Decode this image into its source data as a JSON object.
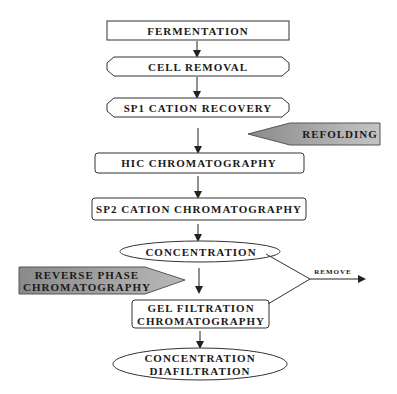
{
  "diagram": {
    "steps": [
      {
        "id": "fermentation",
        "label": "FERMENTATION",
        "shape": "rectangle"
      },
      {
        "id": "cell-removal",
        "label": "CELL REMOVAL",
        "shape": "hexagon"
      },
      {
        "id": "sp1-cation-recovery",
        "label": "SP1 CATION RECOVERY",
        "shape": "hexagon"
      },
      {
        "id": "hic-chromatography",
        "label": "HIC CHROMATOGRAPHY",
        "shape": "rounded-rectangle"
      },
      {
        "id": "sp2-cation-chromatography",
        "label": "SP2 CATION CHROMATOGRAPHY",
        "shape": "rounded-rectangle"
      },
      {
        "id": "concentration",
        "label": "CONCENTRATION",
        "shape": "ellipse"
      },
      {
        "id": "gel-filtration",
        "label_line1": "GEL FILTRATION",
        "label_line2": "CHROMATOGRAPHY",
        "shape": "rounded-rectangle"
      },
      {
        "id": "concentration-diafiltration",
        "label_line1": "CONCENTRATION",
        "label_line2": "DIAFILTRATION",
        "shape": "ellipse"
      }
    ],
    "side_inputs": [
      {
        "id": "refolding",
        "label": "REFOLDING",
        "position": "between SP1 CATION RECOVERY and HIC CHROMATOGRAPHY"
      },
      {
        "id": "reverse-phase",
        "label_line1": "REVERSE PHASE",
        "label_line2": "CHROMATOGRAPHY",
        "position": "between CONCENTRATION and GEL FILTRATION"
      }
    ],
    "outputs": [
      {
        "id": "remove",
        "label": "REMOVE",
        "sources": [
          "CONCENTRATION",
          "GEL FILTRATION CHROMATOGRAPHY"
        ]
      }
    ],
    "colors": {
      "stroke": "#333333",
      "text": "#1a1a1a",
      "side_input_fill_dark": "#8a8a8a",
      "side_input_fill_light": "#c8c8c8"
    }
  }
}
